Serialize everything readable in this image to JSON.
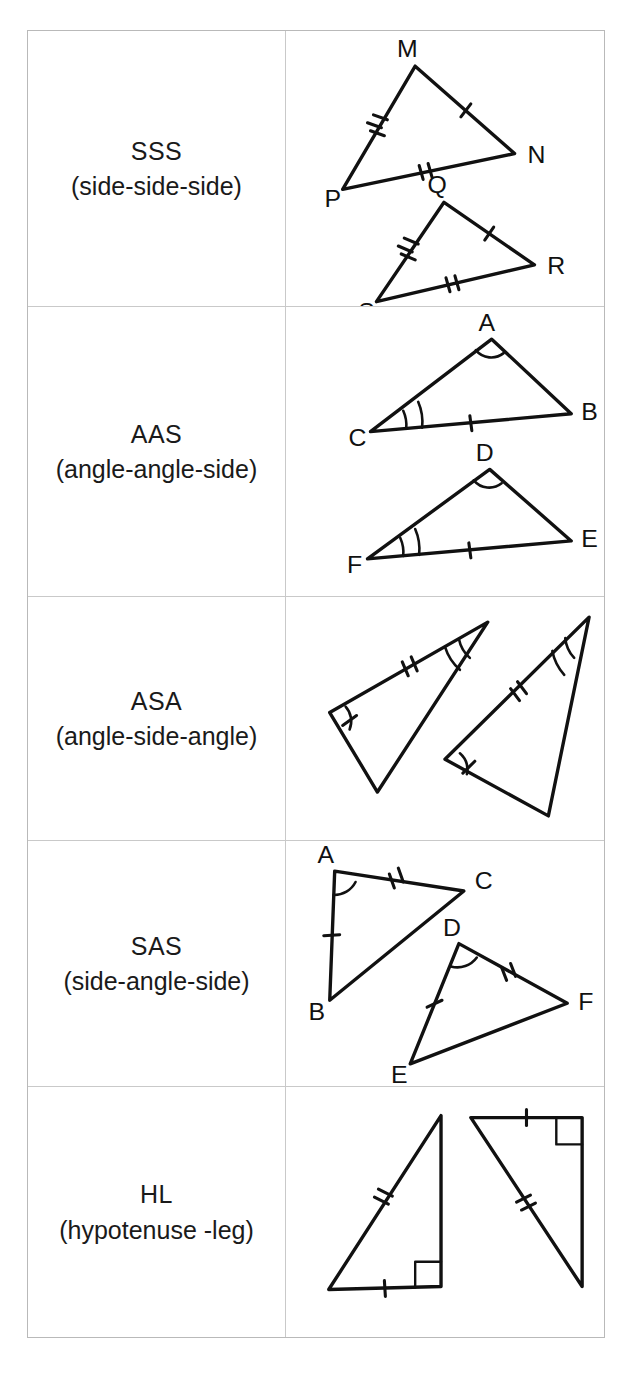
{
  "page": {
    "top_cut_text": "",
    "background_color": "#ffffff",
    "ink_color": "#111111",
    "border_color": "#b9b9b9"
  },
  "table": {
    "name": "triangle-congruence-theorems",
    "columns": [
      "theorem",
      "diagram"
    ],
    "rows": [
      {
        "id": "sss",
        "abbr": "SSS",
        "full": "(side-side-side)",
        "figure": {
          "type": "two-congruent-triangles",
          "triangles": [
            {
              "vertices": [
                {
                  "label": "M",
                  "x": 408,
                  "y": 38
                },
                {
                  "label": "N",
                  "x": 508,
                  "y": 126
                },
                {
                  "label": "P",
                  "x": 335,
                  "y": 162
                }
              ],
              "side_marks": [
                {
                  "from": "M",
                  "to": "N",
                  "ticks": 1
                },
                {
                  "from": "N",
                  "to": "P",
                  "ticks": 2
                },
                {
                  "from": "P",
                  "to": "M",
                  "ticks": 3
                }
              ],
              "angle_marks": []
            },
            {
              "vertices": [
                {
                  "label": "Q",
                  "x": 437,
                  "y": 175
                },
                {
                  "label": "R",
                  "x": 528,
                  "y": 238
                },
                {
                  "label": "S",
                  "x": 369,
                  "y": 275
                }
              ],
              "side_marks": [
                {
                  "from": "Q",
                  "to": "R",
                  "ticks": 1
                },
                {
                  "from": "R",
                  "to": "S",
                  "ticks": 2
                },
                {
                  "from": "S",
                  "to": "Q",
                  "ticks": 3
                }
              ],
              "angle_marks": []
            }
          ]
        }
      },
      {
        "id": "aas",
        "abbr": "AAS",
        "full": "(angle-angle-side)",
        "figure": {
          "type": "two-congruent-triangles",
          "triangles": [
            {
              "vertices": [
                {
                  "label": "A",
                  "x": 485,
                  "y": 36
                },
                {
                  "label": "B",
                  "x": 565,
                  "y": 110
                },
                {
                  "label": "C",
                  "x": 363,
                  "y": 128
                }
              ],
              "side_marks": [
                {
                  "from": "C",
                  "to": "B",
                  "ticks": 1
                }
              ],
              "angle_marks": [
                {
                  "at": "A",
                  "arcs": 1
                },
                {
                  "at": "C",
                  "arcs": 2
                }
              ]
            },
            {
              "vertices": [
                {
                  "label": "D",
                  "x": 483,
                  "y": 165
                },
                {
                  "label": "E",
                  "x": 565,
                  "y": 238
                },
                {
                  "label": "F",
                  "x": 360,
                  "y": 256
                }
              ],
              "side_marks": [
                {
                  "from": "F",
                  "to": "E",
                  "ticks": 1
                }
              ],
              "angle_marks": [
                {
                  "at": "D",
                  "arcs": 1
                },
                {
                  "at": "F",
                  "arcs": 2
                }
              ]
            }
          ]
        }
      },
      {
        "id": "asa",
        "abbr": "ASA",
        "full": "(angle-side-angle)",
        "figure": {
          "type": "two-congruent-triangles",
          "triangles": [
            {
              "vertices": [
                {
                  "label": "",
                  "x": 481,
                  "y": 28
                },
                {
                  "label": "",
                  "x": 322,
                  "y": 118
                },
                {
                  "label": "",
                  "x": 370,
                  "y": 197
                }
              ],
              "side_marks": [
                {
                  "from": "v1",
                  "to": "v2",
                  "ticks": 2
                }
              ],
              "angle_marks": [
                {
                  "at": "v1",
                  "arcs": 2
                },
                {
                  "at": "v2",
                  "arcs": 1
                }
              ]
            },
            {
              "vertices": [
                {
                  "label": "",
                  "x": 583,
                  "y": 22
                },
                {
                  "label": "",
                  "x": 438,
                  "y": 165
                },
                {
                  "label": "",
                  "x": 542,
                  "y": 222
                }
              ],
              "side_marks": [
                {
                  "from": "v1",
                  "to": "v2",
                  "ticks": 2
                }
              ],
              "angle_marks": [
                {
                  "at": "v1",
                  "arcs": 2
                },
                {
                  "at": "v2",
                  "arcs": 1
                }
              ]
            }
          ]
        }
      },
      {
        "id": "sas",
        "abbr": "SAS",
        "full": "(side-angle-side)",
        "figure": {
          "type": "two-congruent-triangles",
          "triangles": [
            {
              "vertices": [
                {
                  "label": "A",
                  "x": 327,
                  "y": 32
                },
                {
                  "label": "B",
                  "x": 322,
                  "y": 162
                },
                {
                  "label": "C",
                  "x": 457,
                  "y": 52
                }
              ],
              "side_marks": [
                {
                  "from": "A",
                  "to": "B",
                  "ticks": 1
                },
                {
                  "from": "A",
                  "to": "C",
                  "ticks": 2
                }
              ],
              "angle_marks": [
                {
                  "at": "A",
                  "arcs": 1
                }
              ]
            },
            {
              "vertices": [
                {
                  "label": "D",
                  "x": 452,
                  "y": 105
                },
                {
                  "label": "E",
                  "x": 403,
                  "y": 226
                },
                {
                  "label": "F",
                  "x": 561,
                  "y": 165
                }
              ],
              "side_marks": [
                {
                  "from": "D",
                  "to": "E",
                  "ticks": 1
                },
                {
                  "from": "D",
                  "to": "F",
                  "ticks": 2
                }
              ],
              "angle_marks": [
                {
                  "at": "D",
                  "arcs": 1
                }
              ]
            }
          ]
        }
      },
      {
        "id": "hl",
        "abbr": "HL",
        "full": "(hypotenuse -leg)",
        "figure": {
          "type": "two-congruent-right-triangles",
          "triangles": [
            {
              "vertices": [
                {
                  "label": "",
                  "x": 434,
                  "y": 30
                },
                {
                  "label": "",
                  "x": 434,
                  "y": 200
                },
                {
                  "label": "",
                  "x": 323,
                  "y": 202
                }
              ],
              "side_marks": [
                {
                  "from": "apex",
                  "to": "corner",
                  "ticks": 2
                },
                {
                  "from": "base",
                  "to": "corner",
                  "ticks": 1
                }
              ],
              "right_angle_at": "v2"
            },
            {
              "vertices": [
                {
                  "label": "",
                  "x": 463,
                  "y": 32
                },
                {
                  "label": "",
                  "x": 576,
                  "y": 32
                },
                {
                  "label": "",
                  "x": 576,
                  "y": 200
                }
              ],
              "side_marks": [
                {
                  "from": "apex",
                  "to": "corner",
                  "ticks": 2
                },
                {
                  "from": "top",
                  "to": "corner",
                  "ticks": 1
                }
              ],
              "right_angle_at": "v2"
            }
          ]
        }
      }
    ]
  }
}
